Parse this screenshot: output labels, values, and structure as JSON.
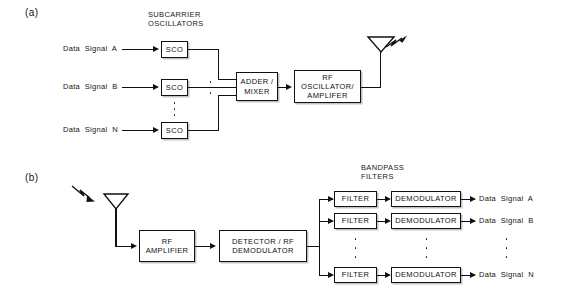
{
  "figure": {
    "panel_a": {
      "tag": "(a)",
      "header": "SUBCARRIER\nOSCILLATORS",
      "inputs": [
        "Data  Signal  A",
        "Data  Signal  B",
        "Data  Signal  N"
      ],
      "sco_blocks": [
        "SCO",
        "SCO",
        "SCO"
      ],
      "adder": "ADDER /\nMIXER",
      "rf_stage": "RF\nOSCILLATOR/\nAMPLIFER",
      "antenna": "transmit-antenna",
      "ellipsis": "vertical-dots"
    },
    "panel_b": {
      "tag": "(b)",
      "antenna": "receive-antenna",
      "rf_amplifier": "RF\nAMPLIFIER",
      "detector": "DETECTOR /\nRF DEMODULATOR",
      "header": "BANDPASS\nFILTERS",
      "filter_blocks": [
        "FILTER",
        "FILTER",
        "FILTER"
      ],
      "demodulator_blocks": [
        "DEMODULATOR",
        "DEMODULATOR",
        "DEMODULATOR"
      ],
      "outputs": [
        "Data  Signal  A",
        "Data  Signal  B",
        "Data  Signal  N"
      ],
      "ellipsis": "vertical-dots"
    }
  },
  "colors": {
    "ink": "#111111",
    "background": "#ffffff"
  }
}
